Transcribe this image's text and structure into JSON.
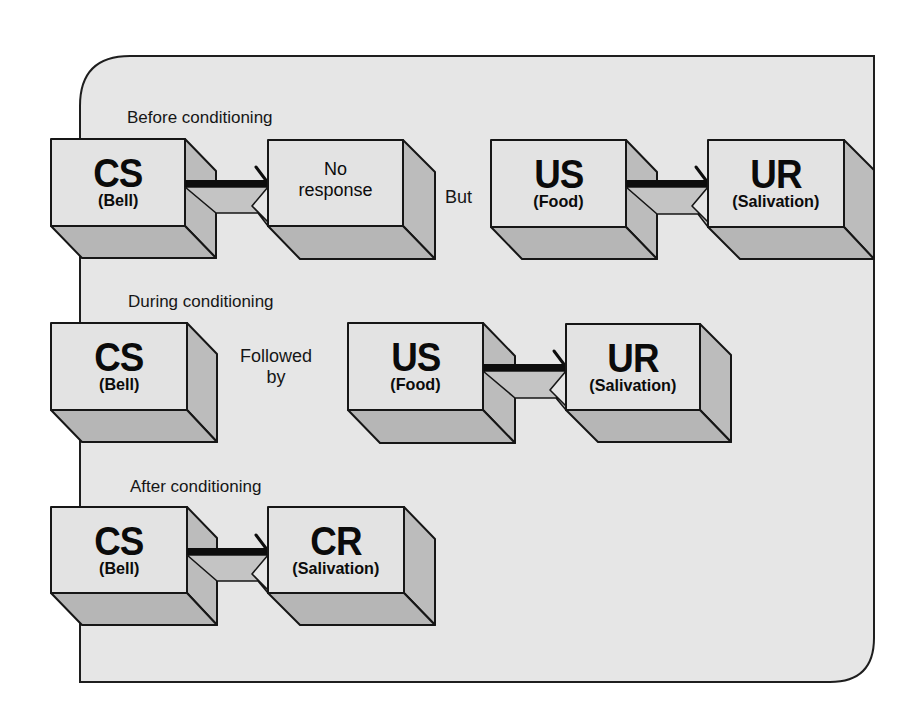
{
  "colors": {
    "panel_background": "#e6e6e6",
    "box_front": "#e3e3e3",
    "box_shadow": "#b8b8b8",
    "outline": "#161616",
    "arrow": "#0d0d0d"
  },
  "sections": [
    {
      "title": "Before conditioning",
      "boxes": [
        {
          "abbr": "CS",
          "sub": "(Bell)"
        },
        {
          "text_line1": "No",
          "text_line2": "response"
        },
        {
          "abbr": "US",
          "sub": "(Food)"
        },
        {
          "abbr": "UR",
          "sub": "(Salivation)"
        }
      ],
      "connector_word": "But",
      "arrows": [
        "CS → No response",
        "US → UR"
      ]
    },
    {
      "title": "During conditioning",
      "boxes": [
        {
          "abbr": "CS",
          "sub": "(Bell)"
        },
        {
          "abbr": "US",
          "sub": "(Food)"
        },
        {
          "abbr": "UR",
          "sub": "(Salivation)"
        }
      ],
      "connector_line1": "Followed",
      "connector_line2": "by",
      "arrows": [
        "US → UR"
      ]
    },
    {
      "title": "After conditioning",
      "boxes": [
        {
          "abbr": "CS",
          "sub": "(Bell)"
        },
        {
          "abbr": "CR",
          "sub": "(Salivation)"
        }
      ],
      "arrows": [
        "CS → CR"
      ]
    }
  ]
}
